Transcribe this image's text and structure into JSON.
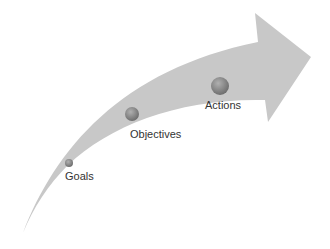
{
  "diagram": {
    "type": "curved-arrow-progression",
    "colors": {
      "arrow": "#c8c8c8",
      "dot": "#8a8a8a",
      "text": "#333333",
      "background": "#ffffff"
    },
    "stages": [
      {
        "label": "Goals"
      },
      {
        "label": "Objectives"
      },
      {
        "label": "Actions"
      }
    ]
  }
}
